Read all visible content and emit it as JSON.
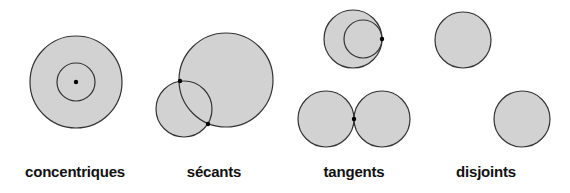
{
  "diagram": {
    "fill": "#d2d2d2",
    "stroke": "#333333",
    "point_color": "#000000",
    "groups": [
      {
        "label": "concentriques",
        "label_x": 75,
        "circles": [
          {
            "cx": 76,
            "cy": 82,
            "r": 46
          },
          {
            "cx": 76,
            "cy": 82,
            "r": 19,
            "outline_only": true
          }
        ],
        "points": [
          {
            "x": 76,
            "y": 82
          }
        ]
      },
      {
        "label": "sécants",
        "label_x": 214,
        "circles": [
          {
            "cx": 226,
            "cy": 80,
            "r": 47
          },
          {
            "cx": 184,
            "cy": 109,
            "r": 28
          }
        ],
        "points": [
          {
            "x": 180,
            "y": 81
          },
          {
            "x": 208,
            "y": 124
          }
        ]
      },
      {
        "label": "tangents",
        "label_x": 354,
        "circles": [
          {
            "cx": 353,
            "cy": 39,
            "r": 29
          },
          {
            "cx": 363,
            "cy": 39,
            "r": 19,
            "outline_only": true
          },
          {
            "cx": 326,
            "cy": 119,
            "r": 28
          },
          {
            "cx": 382,
            "cy": 119,
            "r": 28
          }
        ],
        "points": [
          {
            "x": 382,
            "y": 39
          },
          {
            "x": 354,
            "y": 119
          }
        ]
      },
      {
        "label": "disjoints",
        "label_x": 486,
        "circles": [
          {
            "cx": 463,
            "cy": 40,
            "r": 28
          },
          {
            "cx": 522,
            "cy": 119,
            "r": 28
          }
        ],
        "points": []
      }
    ]
  }
}
